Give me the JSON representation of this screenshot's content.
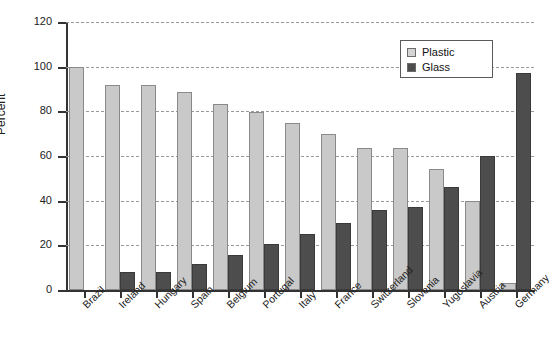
{
  "chart_data": {
    "type": "bar",
    "title": "",
    "xlabel": "",
    "ylabel": "Percent",
    "ylim": [
      0,
      120
    ],
    "yticks": [
      0,
      20,
      40,
      60,
      80,
      100,
      120
    ],
    "grid": true,
    "legend_position": "top-right",
    "categories": [
      "Brazil",
      "Ireland",
      "Hungary",
      "Spain",
      "Belgium",
      "Portugal",
      "Italy",
      "France",
      "Switzerland",
      "Slovenia",
      "Yugoslavia",
      "Austria",
      "Germany"
    ],
    "series": [
      {
        "name": "Plastic",
        "color": "#c9c9c9",
        "values": [
          100,
          92,
          92,
          88.5,
          83.5,
          79.5,
          75,
          70,
          63.5,
          63.5,
          54,
          40,
          3
        ]
      },
      {
        "name": "Glass",
        "color": "#4d4d4d",
        "values": [
          0,
          8,
          8,
          11.5,
          15.5,
          20.5,
          25,
          30,
          36,
          37,
          46,
          60,
          97
        ]
      }
    ]
  },
  "legend": {
    "items": [
      {
        "label": "Plastic",
        "swatch": "plastic"
      },
      {
        "label": "Glass",
        "swatch": "glass"
      }
    ]
  }
}
